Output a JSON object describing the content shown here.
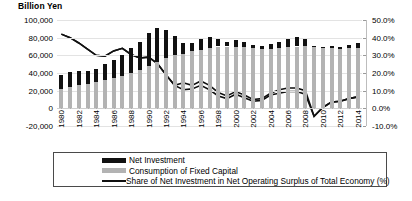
{
  "chart_data": {
    "type": "bar",
    "title": "",
    "ylabel": "Billion Yen",
    "xlabel": "",
    "y2label": "",
    "ylim": [
      -20000,
      100000
    ],
    "y2lim": [
      -10,
      50
    ],
    "grid": true,
    "legend_position": "bottom",
    "stacked": true,
    "y_ticks": [
      "100,000",
      "80,000",
      "60,000",
      "40,000",
      "20,000",
      "0",
      "-20,000"
    ],
    "y2_ticks": [
      "50.0%",
      "40.0%",
      "30.0%",
      "20.0%",
      "10.0%",
      "0.0%",
      "-10.0%"
    ],
    "categories": [
      "1980",
      "1981",
      "1982",
      "1983",
      "1984",
      "1985",
      "1986",
      "1987",
      "1988",
      "1989",
      "1990",
      "1991",
      "1992",
      "1993",
      "1994",
      "1995",
      "1996",
      "1997",
      "1998",
      "1999",
      "2000",
      "2001",
      "2002",
      "2003",
      "2004",
      "2005",
      "2006",
      "2007",
      "2008",
      "2009",
      "2010",
      "2011",
      "2012",
      "2013",
      "2014"
    ],
    "x_tick_labels": [
      "1980",
      "1982",
      "1984",
      "1986",
      "1988",
      "1990",
      "1992",
      "1994",
      "1996",
      "1998",
      "2000",
      "2002",
      "2004",
      "2006",
      "2008",
      "2010",
      "2012",
      "2014"
    ],
    "series": [
      {
        "name": "Consumption of Fixed Capital",
        "type": "bar",
        "color": "#b3b3b3",
        "axis": "left",
        "values": [
          22000,
          24500,
          26500,
          28000,
          30000,
          32500,
          34500,
          36500,
          39500,
          43000,
          47500,
          52500,
          57500,
          60500,
          62000,
          64500,
          66500,
          68500,
          70000,
          70000,
          69500,
          69000,
          68000,
          67500,
          67500,
          68000,
          69000,
          70000,
          71000,
          70500,
          68500,
          68000,
          67500,
          68000,
          68500
        ]
      },
      {
        "name": "Net Investment",
        "type": "bar",
        "color": "#111111",
        "axis": "left",
        "values": [
          16000,
          16500,
          15500,
          14500,
          15000,
          17500,
          20500,
          23500,
          28500,
          32500,
          37500,
          38500,
          31000,
          22000,
          12000,
          10000,
          11500,
          12000,
          8000,
          5500,
          8000,
          6500,
          3500,
          3000,
          5500,
          7500,
          9500,
          11000,
          7000,
          -500,
          1000,
          2500,
          2500,
          3500,
          5000
        ]
      },
      {
        "name": "Share of Net Investment in Net Operating Surplus of Total Economy (%)",
        "type": "line",
        "color": "#111111",
        "axis": "right",
        "values": [
          43.5,
          42.5,
          40.5,
          37.5,
          35.0,
          33.5,
          34.5,
          36.5,
          39.5,
          36.5,
          39.5,
          33.5,
          33.0,
          34.0,
          47.5,
          48.5,
          48.0,
          45.0,
          46.5,
          47.0,
          43.0,
          39.5,
          36.5,
          36.0,
          37.0,
          37.5,
          38.0,
          38.5,
          36.5,
          28.0,
          35.5,
          38.5,
          39.0,
          40.0,
          42.5
        ]
      }
    ],
    "line_series_rendered": [
      {
        "name": "line-upper",
        "values": [
          42.0,
          40.0,
          37.0,
          33.5,
          30.0,
          29.5,
          32.5,
          34.0,
          30.5,
          28.5,
          29.0,
          25.5,
          19.0,
          13.0,
          14.5,
          13.0,
          15.5,
          13.0,
          9.0,
          7.0,
          9.5,
          7.5,
          5.0,
          5.5,
          8.5,
          10.5,
          11.5,
          11.5,
          10.0,
          -4.5,
          0.5,
          3.5,
          4.0,
          5.5,
          6.5
        ]
      },
      {
        "name": "line-lower",
        "values": [
          42.0,
          40.0,
          37.0,
          33.5,
          30.0,
          29.5,
          32.5,
          34.0,
          30.5,
          28.5,
          29.0,
          25.5,
          19.0,
          13.0,
          10.5,
          11.0,
          13.0,
          10.5,
          7.0,
          5.5,
          8.0,
          6.0,
          4.0,
          4.5,
          7.5,
          8.5,
          9.5,
          9.5,
          8.0,
          -4.5,
          0.5,
          3.5,
          4.0,
          5.5,
          6.5
        ]
      }
    ],
    "legend": [
      {
        "label": "Net Investment",
        "marker": "bar-black",
        "color": "#111111"
      },
      {
        "label": "Consumption  of Fixed Capital",
        "marker": "bar-gray",
        "color": "#b3b3b3"
      },
      {
        "label": "Share of Net Investment in Net Operating Surplus of Total Economy (%)",
        "marker": "line",
        "color": "#111111"
      }
    ]
  },
  "caption": ""
}
